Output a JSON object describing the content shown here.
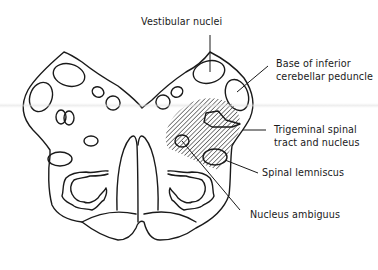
{
  "figure": {
    "labels": [
      {
        "id": "vestibular-nuclei",
        "text_lines": [
          "Vestibular nuclei"
        ]
      },
      {
        "id": "base-inferior-cerebellar-peduncle",
        "text_lines": [
          "Base of inferior",
          "cerebellar peduncle"
        ]
      },
      {
        "id": "trigeminal-spinal-tract",
        "text_lines": [
          "Trigeminal spinal",
          "tract and nucleus"
        ]
      },
      {
        "id": "spinal-lemniscus",
        "text_lines": [
          "Spinal lemniscus"
        ]
      },
      {
        "id": "nucleus-ambiguus",
        "text_lines": [
          "Nucleus ambiguus"
        ]
      }
    ],
    "shaded_region": "Hatched lesion area on right dorsolateral medulla",
    "colors": {
      "line": "#1a1a1a",
      "background": "#ffffff"
    }
  }
}
